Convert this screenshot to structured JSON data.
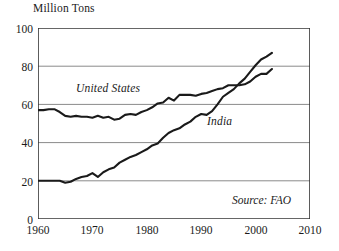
{
  "chart_data": {
    "type": "line",
    "title": "",
    "subtitle": "",
    "xlabel": "",
    "ylabel": "Million Tons",
    "unit_label": "Million Tons",
    "xlim": [
      1960,
      2010
    ],
    "ylim": [
      0,
      100
    ],
    "xticks": [
      1960,
      1970,
      1980,
      1990,
      2000,
      2010
    ],
    "yticks": [
      0,
      20,
      40,
      60,
      80,
      100
    ],
    "gridlines": {
      "horizontal": [
        20,
        40,
        60,
        80
      ],
      "vertical": []
    },
    "grid": true,
    "legend_position": "inline-annotations",
    "annotations": [
      {
        "text": "United States",
        "series": "United States"
      },
      {
        "text": "India",
        "series": "India"
      },
      {
        "text": "Source: FAO",
        "role": "source"
      }
    ],
    "source": "Source: FAO",
    "series": [
      {
        "name": "United States",
        "label": "United States",
        "color": "#1a1a1a",
        "x": [
          1960,
          1961,
          1962,
          1963,
          1964,
          1965,
          1966,
          1967,
          1968,
          1969,
          1970,
          1971,
          1972,
          1973,
          1974,
          1975,
          1976,
          1977,
          1978,
          1979,
          1980,
          1981,
          1982,
          1983,
          1984,
          1985,
          1986,
          1987,
          1988,
          1989,
          1990,
          1991,
          1992,
          1993,
          1994,
          1995,
          1996,
          1997,
          1998,
          1999,
          2000,
          2001,
          2002,
          2003
        ],
        "values": [
          57,
          57,
          57.5,
          57.5,
          56,
          54,
          53.5,
          54,
          53.5,
          53.5,
          53,
          54,
          53,
          53.5,
          52,
          52.5,
          54.5,
          55,
          54.5,
          56,
          57,
          58.5,
          60.5,
          61,
          63.5,
          62,
          65,
          65,
          65,
          64.5,
          65.5,
          66,
          67,
          68,
          68.5,
          70,
          70,
          70,
          70.5,
          72,
          74.5,
          76,
          76,
          78.5
        ]
      },
      {
        "name": "India",
        "label": "India",
        "color": "#1a1a1a",
        "x": [
          1960,
          1961,
          1962,
          1963,
          1964,
          1965,
          1966,
          1967,
          1968,
          1969,
          1970,
          1971,
          1972,
          1973,
          1974,
          1975,
          1976,
          1977,
          1978,
          1979,
          1980,
          1981,
          1982,
          1983,
          1984,
          1985,
          1986,
          1987,
          1988,
          1989,
          1990,
          1991,
          1992,
          1993,
          1994,
          1995,
          1996,
          1997,
          1998,
          1999,
          2000,
          2001,
          2002,
          2003
        ],
        "values": [
          20,
          20,
          20,
          20,
          20,
          19,
          19.5,
          21,
          22,
          22.5,
          24,
          22,
          24.5,
          26,
          27,
          29.5,
          31,
          32.5,
          33.5,
          35,
          36.5,
          38.5,
          39.5,
          42.5,
          45,
          46.5,
          47.5,
          49.5,
          51,
          53.5,
          55,
          54.5,
          56.5,
          60,
          64,
          66,
          68,
          71,
          73.5,
          77,
          80.5,
          83.5,
          85,
          87
        ]
      }
    ]
  },
  "axis": {
    "ytick_labels": [
      "100",
      "80",
      "60",
      "40",
      "20",
      "0"
    ],
    "xtick_labels": [
      "1960",
      "1970",
      "1980",
      "1990",
      "2000",
      "2010"
    ]
  },
  "colors": {
    "line": "#1a1a1a",
    "gridline": "#8a8a8a",
    "axis": "#333333",
    "background": "#ffffff"
  }
}
